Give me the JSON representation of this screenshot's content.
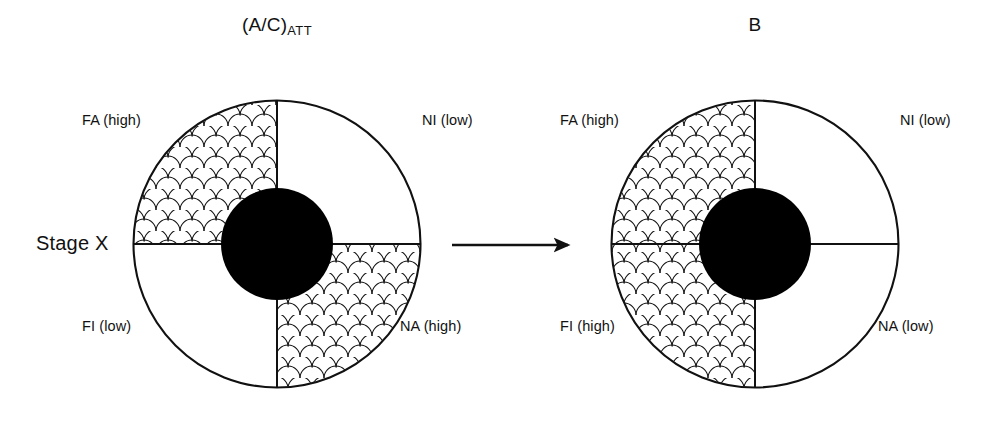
{
  "figure": {
    "background_color": "#ffffff",
    "stroke_color": "#111111",
    "core_fill_color": "#000000",
    "stage_label": "Stage X",
    "arrow": {
      "name": "transition-arrow",
      "direction": "right",
      "from_panel": "(A/C)ATT",
      "to_panel": "B"
    },
    "panels": [
      {
        "id": "left",
        "title_main": "(A/C)",
        "title_sub": "ATT",
        "center_x": 277,
        "center_y": 244,
        "outer_radius": 144,
        "core_radius": 56,
        "quadrants": [
          {
            "position": "top-left",
            "code": "FA",
            "level": "high",
            "label": "FA (high)",
            "shaded": true
          },
          {
            "position": "top-right",
            "code": "NI",
            "level": "low",
            "label": "NI (low)",
            "shaded": false
          },
          {
            "position": "bottom-left",
            "code": "FI",
            "level": "low",
            "label": "FI (low)",
            "shaded": false
          },
          {
            "position": "bottom-right",
            "code": "NA",
            "level": "high",
            "label": "NA (high)",
            "shaded": true
          }
        ]
      },
      {
        "id": "right",
        "title_main": "B",
        "title_sub": "",
        "center_x": 755,
        "center_y": 244,
        "outer_radius": 144,
        "core_radius": 56,
        "quadrants": [
          {
            "position": "top-left",
            "code": "FA",
            "level": "high",
            "label": "FA (high)",
            "shaded": true
          },
          {
            "position": "top-right",
            "code": "NI",
            "level": "low",
            "label": "NI (low)",
            "shaded": false
          },
          {
            "position": "bottom-left",
            "code": "FI",
            "level": "high",
            "label": "FI (high)",
            "shaded": true
          },
          {
            "position": "bottom-right",
            "code": "NA",
            "level": "low",
            "label": "NA (low)",
            "shaded": false
          }
        ]
      }
    ]
  }
}
